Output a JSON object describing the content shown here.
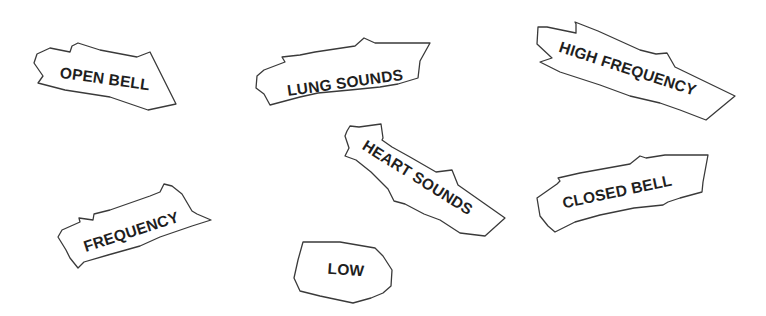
{
  "diagram": {
    "type": "torn-paper word cards",
    "labels": [
      {
        "id": "open-bell",
        "text": "OPEN BELL"
      },
      {
        "id": "lung-sounds",
        "text": "LUNG SOUNDS"
      },
      {
        "id": "high-frequency",
        "text": "HIGH FREQUENCY"
      },
      {
        "id": "heart-sounds",
        "text": "HEART SOUNDS"
      },
      {
        "id": "closed-bell",
        "text": "CLOSED BELL"
      },
      {
        "id": "frequency",
        "text": "FREQUENCY"
      },
      {
        "id": "low",
        "text": "LOW"
      }
    ]
  },
  "colors": {
    "background": "#ffffff",
    "outline": "#3a3a3a",
    "text": "#1f1f1f"
  }
}
